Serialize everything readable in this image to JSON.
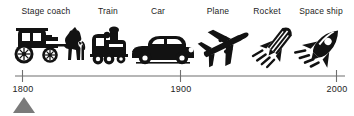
{
  "figure": {
    "type": "timeline"
  },
  "axis": {
    "line_color": "#6f6f6f",
    "ticks": [
      {
        "label": "1800",
        "value": 1800
      },
      {
        "label": "1900",
        "value": 1900
      },
      {
        "label": "2000",
        "value": 2000
      }
    ],
    "range_start": 1800,
    "range_end": 2000
  },
  "marker": {
    "name": "current-position-triangle",
    "at_label": "1800",
    "color": "#7a7a7a"
  },
  "items": [
    {
      "label": "Stage coach",
      "icon": "stage-coach-icon"
    },
    {
      "label": "Train",
      "icon": "train-icon"
    },
    {
      "label": "Car",
      "icon": "car-icon"
    },
    {
      "label": "Plane",
      "icon": "plane-icon"
    },
    {
      "label": "Rocket",
      "icon": "rocket-icon"
    },
    {
      "label": "Space ship",
      "icon": "space-ship-icon"
    }
  ],
  "colors": {
    "ink": "#121212",
    "axis": "#6f6f6f",
    "text": "#1d1d1d",
    "marker": "#7a7a7a"
  }
}
